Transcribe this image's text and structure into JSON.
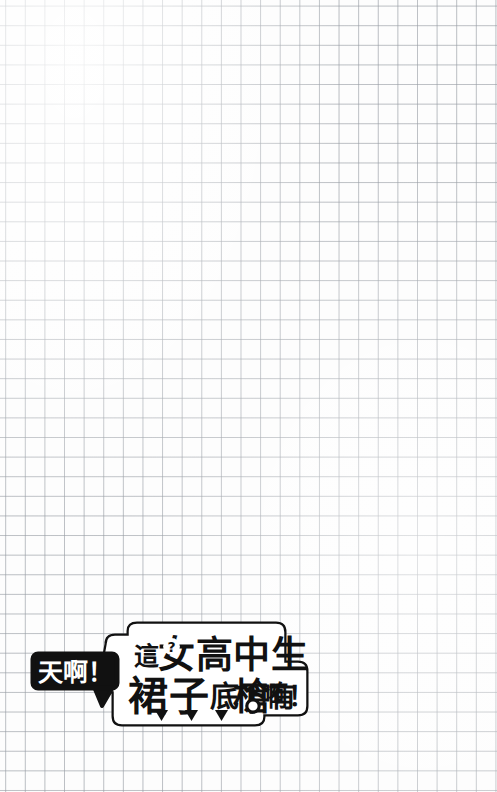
{
  "page": {
    "width": 497,
    "height": 792,
    "background_style": "graph-paper-grid",
    "grid": {
      "cell_size_px": 19.6,
      "line_color": "#969ba2",
      "paper_color": "#fdfdfd"
    }
  },
  "caption": {
    "name": "manga-caption-sticker",
    "colors": {
      "ink": "#111111",
      "paper": "#ffffff"
    },
    "exclaim_bubble": {
      "text": "天啊！",
      "style": "black-fill-white-text",
      "has_tail": true,
      "tail_direction": "down-right"
    },
    "main_balloon": {
      "style": "white-fill-black-outline",
      "line_1": "這女高中生",
      "line_2": "裙子底下有槍啊！",
      "full_text": "這女高中生裙子底下有槍啊！",
      "accent_marks": {
        "question_mark_in_char": "？",
        "question_mark_host_char": "女",
        "keyhole_in_char": "槍"
      },
      "bottom_arrows": [
        "▼",
        "▼",
        "▼"
      ]
    }
  }
}
